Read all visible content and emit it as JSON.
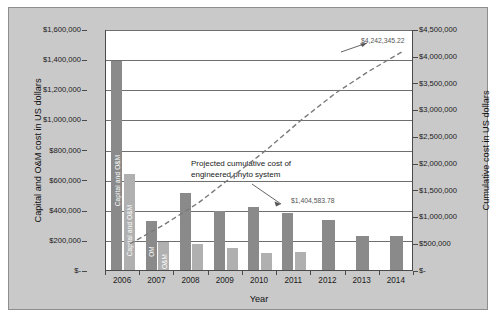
{
  "chart_data": {
    "type": "bar",
    "title": "",
    "xlabel": "Year",
    "ylabel": "Capital and O&M cost in US dollars",
    "ylabel_secondary": "Cumulative cost in US dollars",
    "categories": [
      "2006",
      "2007",
      "2008",
      "2009",
      "2010",
      "2011",
      "2012",
      "2013",
      "2014"
    ],
    "ylim": [
      0,
      1600000
    ],
    "ylim_secondary": [
      0,
      4500000
    ],
    "grid": true,
    "legend_position": "none",
    "yticks": [
      "$-",
      "$200,000",
      "$400,000",
      "$600,000",
      "$800,000",
      "$1,000,000",
      "$1,200,000",
      "$1,400,000",
      "$1,600,000"
    ],
    "ytick_values": [
      0,
      200000,
      400000,
      600000,
      800000,
      1000000,
      1200000,
      1400000,
      1600000
    ],
    "yticks_secondary": [
      "$-",
      "$500,000",
      "$1,000,000",
      "$1,500,000",
      "$2,000,000",
      "$2,500,000",
      "$3,000,000",
      "$3,500,000",
      "$4,000,000",
      "$4,500,000"
    ],
    "ytick_values_secondary": [
      0,
      500000,
      1000000,
      1500000,
      2000000,
      2500000,
      3000000,
      3500000,
      4000000,
      4500000
    ],
    "series": [
      {
        "name": "Capital and O&M",
        "color": "#8a8a8a",
        "axis": "left",
        "values": [
          1393000,
          335000,
          518000,
          398000,
          428000,
          388000,
          340000,
          230000,
          232000
        ]
      },
      {
        "name": "O&M",
        "color": "#b0b0b0",
        "axis": "left",
        "values": [
          645000,
          190000,
          178000,
          152000,
          122000,
          125000,
          null,
          null,
          null
        ]
      }
    ],
    "bar_value_labels": [
      {
        "category": "2006",
        "series": "Capital and O&M",
        "text": "Capital and O&M"
      },
      {
        "category": "2006",
        "series": "O&M",
        "text": "Capital and O&M"
      },
      {
        "category": "2007",
        "series": "Capital and O&M",
        "text": "OM"
      },
      {
        "category": "2007",
        "series": "O&M",
        "text": "O&M"
      }
    ],
    "projection_line": {
      "name": "Projected cumulative cost of engineered phyto system",
      "style": "dashed",
      "color": "#7a7a7a",
      "axis": "right",
      "x": [
        "2006",
        "2007",
        "2008",
        "2009",
        "2010",
        "2011",
        "2012",
        "2013",
        "2014"
      ],
      "values": [
        640000,
        1000000,
        1404583.78,
        1900000,
        2400000,
        2950000,
        3450000,
        3870000,
        4242345.22
      ]
    },
    "annotations": [
      {
        "id": "note",
        "text_line1": "Projected cumulative cost of",
        "text_line2": "engineered phyto system"
      },
      {
        "id": "end-value",
        "text": "$4,242,345.22"
      },
      {
        "id": "mid-value",
        "text": "$1,404,583.78"
      }
    ],
    "colors": {
      "plate_background": "#c9c9c9",
      "plot_background": "#ffffff",
      "capital_bar": "#8a8a8a",
      "om_bar": "#b0b0b0",
      "gridline": "#6f6f6f",
      "axis": "#4a4a4a",
      "dashed_line": "#7a7a7a"
    }
  }
}
